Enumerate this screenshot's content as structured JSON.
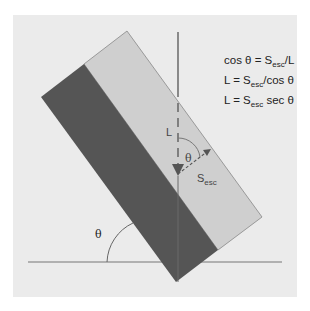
{
  "diagram": {
    "type": "geometry-illustration",
    "equations": [
      {
        "lhs": "cos θ = S",
        "sub": "esc",
        "rhs": "/L"
      },
      {
        "lhs": "L = S",
        "sub": "esc",
        "rhs": "/cos θ"
      },
      {
        "lhs": "L  = S",
        "sub": "esc",
        "rhs": " sec θ"
      }
    ],
    "labels": {
      "path_length": "L",
      "inner_angle": "θ",
      "escape_symbol": "S",
      "escape_sub": "esc",
      "tilt_angle": "θ"
    },
    "colors": {
      "panel": "#ebebeb",
      "dark_strip": "#555555",
      "light_strip": "#cfcfcf",
      "line": "#666666"
    }
  }
}
